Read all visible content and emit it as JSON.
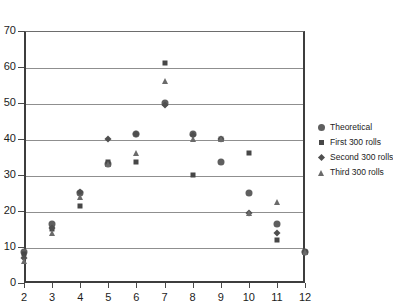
{
  "chart_data": {
    "type": "scatter",
    "title": "",
    "xlabel": "",
    "ylabel": "",
    "xlim": [
      2,
      12
    ],
    "ylim": [
      0,
      70
    ],
    "ytick_labels": [
      "0",
      "10",
      "20",
      "30",
      "40",
      "50",
      "60",
      "70"
    ],
    "yticks": [
      0,
      10,
      20,
      30,
      40,
      50,
      60,
      70
    ],
    "xtick_labels": [
      "2",
      "3",
      "4",
      "5",
      "6",
      "7",
      "8",
      "9",
      "10",
      "11",
      "12"
    ],
    "xticks": [
      2,
      3,
      4,
      5,
      6,
      7,
      8,
      9,
      10,
      11,
      12
    ],
    "grid": true,
    "grid_axis": "y",
    "legend_position": "right",
    "x": [
      2,
      3,
      4,
      5,
      6,
      7,
      8,
      9,
      10,
      11,
      12
    ],
    "series": [
      {
        "name": "Theoretical",
        "marker": "circle",
        "values": [
          8.5,
          16.5,
          25,
          33,
          41.5,
          50,
          41.5,
          33.5,
          25,
          16.5,
          8.5
        ]
      },
      {
        "name": "First 300 rolls",
        "marker": "square",
        "values": [
          8,
          15,
          21.5,
          33.5,
          33.5,
          61,
          30,
          40,
          36,
          12,
          8.5
        ]
      },
      {
        "name": "Second 300 rolls",
        "marker": "diamond",
        "values": [
          7,
          15.3,
          25.2,
          40,
          41.5,
          49.5,
          41,
          40,
          19.5,
          14,
          8.5
        ]
      },
      {
        "name": "Third 300 rolls",
        "marker": "triangle",
        "values": [
          6,
          14,
          24,
          33,
          36,
          56,
          40,
          40,
          19.5,
          22.5,
          8.5
        ]
      }
    ]
  },
  "legend": {
    "items": [
      {
        "label": "Theoretical",
        "marker": "circle"
      },
      {
        "label": "First 300 rolls",
        "marker": "square"
      },
      {
        "label": "Second 300 rolls",
        "marker": "diamond"
      },
      {
        "label": "Third 300 rolls",
        "marker": "triangle"
      }
    ]
  },
  "colors": {
    "axis": "#3d3d3d",
    "gridline": "#8f8f8f",
    "marker_circle": "#5f5f5f",
    "marker_square": "#474747",
    "marker_diamond": "#4f4f4f",
    "marker_triangle": "#6a6a6a",
    "background": "#ffffff",
    "text": "#1c1c1c"
  }
}
